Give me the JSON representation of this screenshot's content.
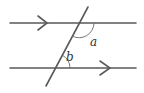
{
  "diagram": {
    "title": "",
    "type": "parallel lines cut by a transversal",
    "colors": {
      "line": "#5a5a5a",
      "arc": "#6a6a6a",
      "label": "#333333",
      "background": "#ffffff"
    },
    "lines": [
      {
        "id": "top-parallel",
        "x1": 10,
        "y1": 23,
        "x2": 136,
        "y2": 23,
        "arrow": {
          "tip_x": 47,
          "y": 23,
          "direction": "right"
        }
      },
      {
        "id": "bottom-parallel",
        "x1": 10,
        "y1": 68,
        "x2": 136,
        "y2": 68,
        "arrow": {
          "tip_x": 110,
          "y": 68,
          "direction": "right"
        }
      },
      {
        "id": "transversal",
        "x1": 88,
        "y1": 7,
        "x2": 46,
        "y2": 86
      }
    ],
    "angles": [
      {
        "label": "a",
        "vertex": [
          79,
          23
        ],
        "position": "below top line, right of transversal",
        "label_x": 92,
        "label_y": 44
      },
      {
        "label": "b",
        "vertex": [
          55,
          68
        ],
        "position": "above bottom line, right of transversal",
        "label_x": 68,
        "label_y": 59
      }
    ]
  }
}
